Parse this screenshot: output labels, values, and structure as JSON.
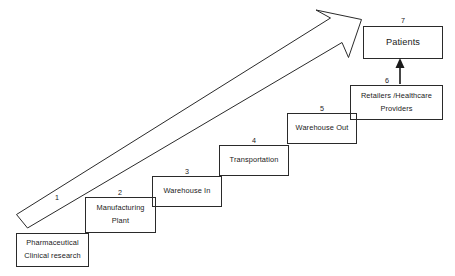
{
  "diagram": {
    "stroke_color": "#2a2a2a",
    "text_color": "#1a1a1a",
    "background_color": "#ffffff",
    "stages": [
      {
        "number": "1",
        "lines": [
          "Pharmaceutical",
          "Clinical research"
        ],
        "line1": "Pharmaceutical",
        "line2": "Clinical research"
      },
      {
        "number": "2",
        "lines": [
          "Manufacturing",
          "Plant"
        ],
        "line1": "Manufacturing",
        "line2": "Plant"
      },
      {
        "number": "3",
        "lines": [
          "Warehouse In"
        ],
        "line1": "Warehouse In",
        "line2": ""
      },
      {
        "number": "4",
        "lines": [
          "Transportation"
        ],
        "line1": "Transportation",
        "line2": ""
      },
      {
        "number": "5",
        "lines": [
          "Warehouse Out"
        ],
        "line1": "Warehouse Out",
        "line2": ""
      },
      {
        "number": "6",
        "lines": [
          "Retailers /Healthcare",
          "Providers"
        ],
        "line1": "Retailers /Healthcare",
        "line2": "Providers"
      },
      {
        "number": "7",
        "lines": [
          "Patients"
        ],
        "line1": "Patients",
        "line2": ""
      }
    ],
    "connectors": [
      {
        "name": "main-progress-arrow",
        "from_stage": "1",
        "to_stage": "7",
        "style": "outlined-diagonal-arrow"
      },
      {
        "name": "retailers-to-patients-arrow",
        "from_stage": "6",
        "to_stage": "7",
        "style": "solid-vertical-arrow"
      }
    ]
  }
}
